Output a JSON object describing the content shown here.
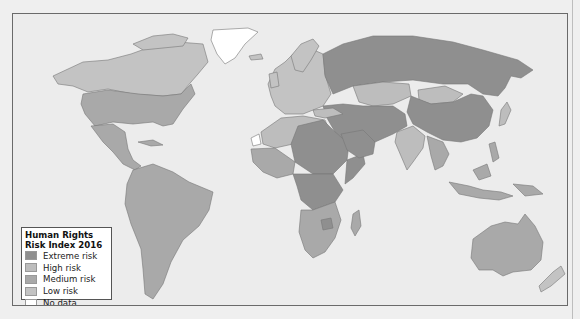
{
  "map": {
    "ocean_color": "#ececec",
    "border_color": "#6a6a6a"
  },
  "legend": {
    "title_line1": "Human Rights",
    "title_line2": "Risk Index 2016",
    "items": [
      {
        "label": "Extreme risk",
        "color": "#8f8f8f"
      },
      {
        "label": "High risk",
        "color": "#bdbdbd"
      },
      {
        "label": "Medium risk",
        "color": "#a9a9a9"
      },
      {
        "label": "Low risk",
        "color": "#c3c3c3"
      },
      {
        "label": "No data",
        "color": "#ffffff"
      }
    ]
  },
  "regions": {
    "north_america": "Medium risk",
    "greenland": "No data",
    "south_america": "Medium risk",
    "europe": "Low risk",
    "russia": "Extreme risk",
    "china": "Extreme risk",
    "middle_east": "Extreme risk",
    "central_africa": "Extreme risk",
    "southern_africa": "Medium risk",
    "india": "High risk",
    "kazakhstan_mongolia": "High risk",
    "southeast_asia": "Medium risk",
    "australia": "Medium risk",
    "new_zealand": "Low risk"
  }
}
